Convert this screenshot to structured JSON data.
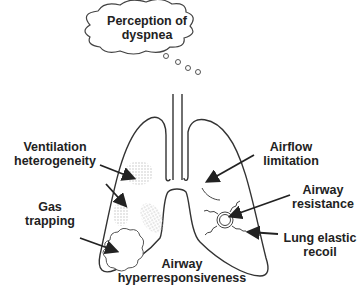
{
  "thought_bubble": {
    "line1": "Perception of",
    "line2": "dyspnea"
  },
  "labels": {
    "ventilation": {
      "line1": "Ventilation",
      "line2": "heterogeneity"
    },
    "gas_trapping": {
      "line1": "Gas",
      "line2": "trapping"
    },
    "airflow": {
      "line1": "Airflow",
      "line2": "limitation"
    },
    "airway_resistance": {
      "line1": "Airway",
      "line2": "resistance"
    },
    "lung_elastic": {
      "line1": "Lung elastic",
      "line2": "recoil"
    },
    "hyperresponsiveness": {
      "line1": "Airway",
      "line2": "hyperresponsiveness"
    }
  },
  "colors": {
    "line": "#333333",
    "stipple": "#c8c8c8",
    "text": "#222222"
  }
}
